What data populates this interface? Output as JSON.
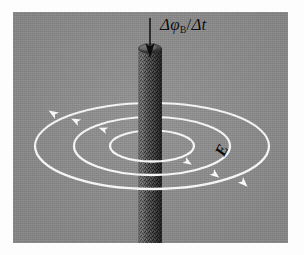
{
  "figure": {
    "background_color": "#8d8d8d",
    "frame_color": "#fdfdfd",
    "panel": {
      "x": 13,
      "y": 12,
      "width": 275,
      "height": 231
    }
  },
  "labels": {
    "flux_rate": {
      "text": "Δφ",
      "subscript": "B",
      "divider": "/",
      "denominator": "Δt",
      "full": "ΔφB/Δt",
      "meaning": "rate-of-change-of-magnetic-flux",
      "color": "#0b0b0b",
      "position": {
        "x": 160,
        "y": 16
      }
    },
    "efield": {
      "text": "E",
      "meaning": "induced-electric-field",
      "color": "#0b0b0b",
      "rotation_deg": -64,
      "position": {
        "x": 222,
        "y": 143
      }
    }
  },
  "cylinder": {
    "name": "magnetic-field-region-cylinder",
    "fill_color": "#4a4a4a",
    "texture": "stippled",
    "center_x": 150,
    "width": 23,
    "top_y": 48,
    "bottom_y": 243,
    "cap_rx": 11.5,
    "cap_ry": 4.5
  },
  "flux_arrow": {
    "name": "downward-flux-arrow",
    "color": "#0f0f0f",
    "x": 150,
    "start_y": 18,
    "end_y": 56,
    "direction": "down"
  },
  "field_lines": {
    "name": "induced-electric-field-lines",
    "color": "#f2f2f2",
    "stroke_width": 2.1,
    "center": {
      "x": 152,
      "y": 146
    },
    "perspective_ratio": 0.37,
    "ellipses": [
      {
        "index": 1,
        "rx": 42,
        "ry": 15.5,
        "label": "inner-field-line"
      },
      {
        "index": 2,
        "rx": 78,
        "ry": 29,
        "label": "middle-field-line"
      },
      {
        "index": 3,
        "rx": 117,
        "ry": 43,
        "label": "outer-field-line"
      }
    ],
    "arrowheads": [
      {
        "on_ellipse": 1,
        "x": 110,
        "y": 124,
        "angle": -150,
        "side": "left-back"
      },
      {
        "on_ellipse": 2,
        "x": 80,
        "y": 114,
        "angle": -155,
        "side": "left-back"
      },
      {
        "on_ellipse": 3,
        "x": 56,
        "y": 109,
        "angle": -160,
        "side": "left-back"
      },
      {
        "on_ellipse": 1,
        "x": 193,
        "y": 158,
        "angle": 35,
        "side": "right-front"
      },
      {
        "on_ellipse": 2,
        "x": 218,
        "y": 155,
        "angle": 38,
        "side": "right-front"
      },
      {
        "on_ellipse": 3,
        "x": 248,
        "y": 161,
        "angle": 42,
        "side": "right-front"
      }
    ],
    "circulation_direction": "counterclockwise-viewed-from-above"
  }
}
